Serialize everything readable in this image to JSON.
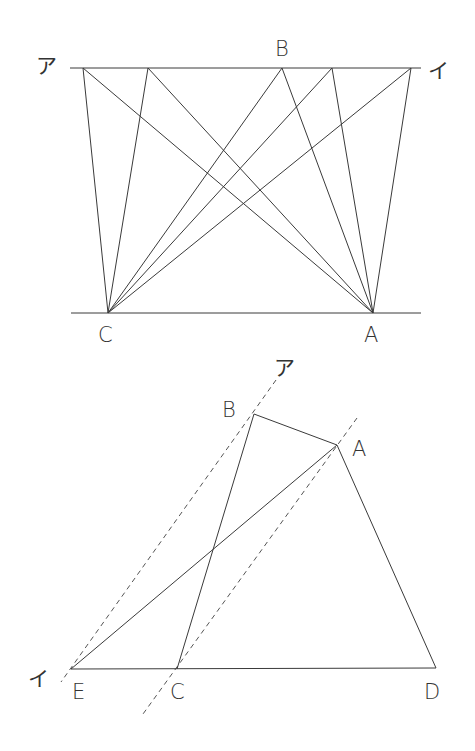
{
  "figure1": {
    "labels": {
      "a": "ア",
      "i": "イ",
      "B": "B",
      "C": "C",
      "A": "A"
    }
  },
  "figure2": {
    "labels": {
      "a": "ア",
      "i": "イ",
      "B": "B",
      "A": "A",
      "E": "E",
      "C": "C",
      "D": "D"
    }
  }
}
